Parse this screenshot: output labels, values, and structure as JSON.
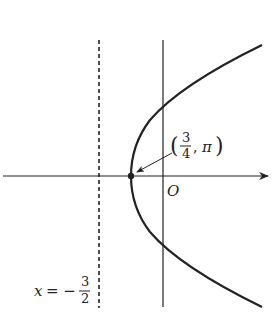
{
  "diagram": {
    "type": "polar-conic-parabola",
    "colors": {
      "stroke": "#222222",
      "background": "#ffffff"
    },
    "axes": {
      "x_axis": {
        "direction": "right",
        "arrow": true
      },
      "y_axis": {
        "direction": "vertical",
        "arrow": false
      },
      "origin_label": "O"
    },
    "directrix": {
      "style": "dashed",
      "label_lhs": "x = −",
      "label_num": "3",
      "label_den": "2"
    },
    "vertex": {
      "label_open": "(",
      "label_num": "3",
      "label_den": "4",
      "label_sep": ",",
      "label_pi": "π",
      "label_close": ")"
    },
    "curve": {
      "description": "parabola opening right with vertex left of origin"
    }
  }
}
